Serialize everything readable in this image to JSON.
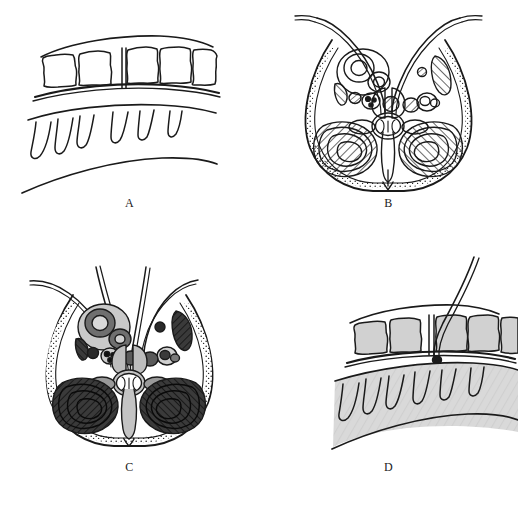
{
  "figure": {
    "background_color": "#ffffff",
    "ink_color": "#1a1a1a",
    "panel_count": 4,
    "layout": "2x2 grid"
  },
  "panels": [
    {
      "id": "A",
      "label": "A",
      "style": "uncolored line drawing",
      "description": "Sagittal outline: row of five vertebral bodies with an interspinous gap, dural sac line, and six nerve-root projections over a lower curved border",
      "fill": "none",
      "vertebra_count": 5,
      "gap_after_vertebra": 2,
      "nerve_root_count": 6,
      "has_needle": false
    },
    {
      "id": "B",
      "label": "B",
      "style": "uncolored line drawing with hatching",
      "description": "Axial cross-section of the lumbar region: heart-shaped body wall, paired concentric vessels, hatched paraspinal muscle masses, central spinal canal with butterfly-shaped cord",
      "fill": "none",
      "hatched_regions": 8,
      "vessel_rings": 4,
      "has_needle": false
    },
    {
      "id": "C",
      "label": "C",
      "style": "gray-shaded version of B",
      "description": "Same axial cross-section as B, shaded: gray soft tissue, dark hatched paraspinal muscles, gray vessel rings and central cord, with two needles entering from above",
      "fill": "#9a9a9a",
      "hatched_regions": 8,
      "vessel_rings": 4,
      "has_needle": true,
      "needle_count": 2
    },
    {
      "id": "D",
      "label": "D",
      "style": "gray-shaded version of A",
      "description": "Same sagittal view as A, shaded gray, with a curved catheter passing through the interspinous gap and a bead at its tip",
      "fill": "#d6d6d6",
      "vertebra_count": 5,
      "gap_after_vertebra": 2,
      "nerve_root_count": 6,
      "has_needle": true,
      "needle_count": 1
    }
  ],
  "colors": {
    "page_background": "#ffffff",
    "ink": "#1a1a1a",
    "light_gray_fill": "#d6d6d6",
    "mid_gray_fill": "#9a9a9a",
    "dark_gray_fill": "#4a4a4a",
    "muscle_dark": "#3a3a3a"
  }
}
